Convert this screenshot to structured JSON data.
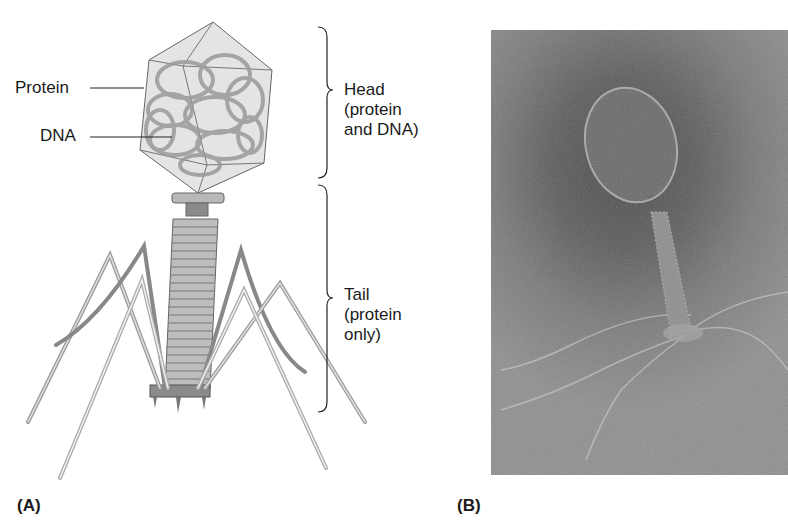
{
  "figure": {
    "panel_a": {
      "label": "(A)",
      "callouts": [
        {
          "text": "Protein"
        },
        {
          "text": "DNA"
        }
      ],
      "brackets": [
        {
          "lines": [
            "Head",
            "(protein",
            "and DNA)"
          ]
        },
        {
          "lines": [
            "Tail",
            "(protein",
            "only)"
          ]
        }
      ]
    },
    "panel_b": {
      "label": "(B)",
      "description": "electron micrograph of bacteriophage"
    }
  },
  "colors": {
    "diagram_gray": "#9a9a9a",
    "diagram_light": "#d8d8d8",
    "micrograph_dark": "#4a4a4a",
    "micrograph_light": "#8f8f8f"
  }
}
